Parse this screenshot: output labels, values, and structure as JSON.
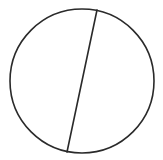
{
  "diagram": {
    "type": "circle-with-chord",
    "background": "#ffffff",
    "stroke_color": "#2a2a2a",
    "circle": {
      "cx": 82,
      "cy": 81,
      "r": 72,
      "stroke_width": 1.6
    },
    "chord": {
      "x1": 97,
      "y1": 10,
      "x2": 67,
      "y2": 152,
      "stroke_width": 1.6
    }
  }
}
